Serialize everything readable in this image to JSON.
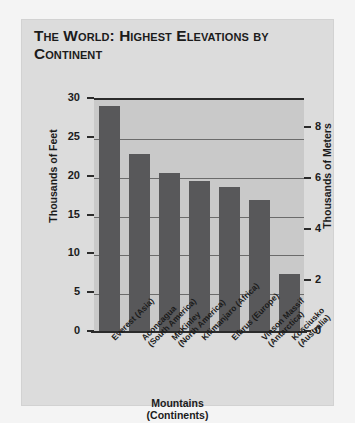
{
  "card": {
    "title": "The World: Highest Elevations by Continent"
  },
  "chart_data": {
    "type": "bar",
    "title": "The World: Highest Elevations by Continent",
    "xlabel": "Mountains (Continents)",
    "xlabel_line1": "Mountains",
    "xlabel_line2": "(Continents)",
    "ylabel": "Thousands of Feet",
    "ylabel_secondary": "Thousands of Meters",
    "ylim": [
      0,
      30
    ],
    "ylim_secondary": [
      0,
      9.144
    ],
    "yticks": [
      30,
      25,
      20,
      15,
      10,
      5,
      0
    ],
    "yticks_secondary": [
      8,
      6,
      4,
      2,
      0
    ],
    "grid": true,
    "legend": "none",
    "bar_color": "#58585a",
    "plot_background": "#c9c9c9",
    "categories": [
      "Everest (Asia)",
      "Aconcagua (South America)",
      "McKinley (North America)",
      "Kilimanjaro (Africa)",
      "Elbrus (Europe)",
      "Vinson Massif (Antarctica)",
      "Kosciusko (Australia)"
    ],
    "category_lines": [
      [
        "Everest (Asia)"
      ],
      [
        "Aconcagua",
        "(South America)"
      ],
      [
        "McKinley",
        "(North America)"
      ],
      [
        "Kilimanjaro (Africa)"
      ],
      [
        "Elbrus (Europe)"
      ],
      [
        "Vinson Massif",
        "(Antarctica)"
      ],
      [
        "Kosciusko",
        "(Australia)"
      ]
    ],
    "values": [
      29.0,
      22.8,
      20.3,
      19.3,
      18.5,
      16.9,
      7.3
    ]
  }
}
